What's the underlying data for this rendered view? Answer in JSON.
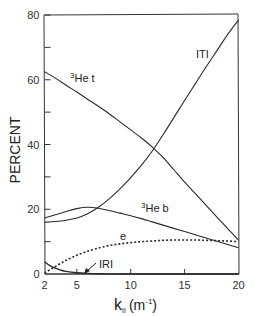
{
  "chart_data": {
    "type": "line",
    "title": "",
    "xlabel": "k_∥ (m⁻¹)",
    "xlabel_parts": {
      "main": "k",
      "sub": "II",
      "unit": "(m",
      "sup": "-1",
      "close": ")"
    },
    "ylabel": "PERCENT",
    "xlim": [
      2,
      20
    ],
    "ylim": [
      0,
      80
    ],
    "xticks": [
      2,
      5,
      10,
      15,
      20
    ],
    "yticks": [
      0,
      20,
      40,
      60,
      80
    ],
    "yticks_minor": [
      10,
      30,
      50,
      70
    ],
    "grid": false,
    "legend": "inline labels",
    "series": [
      {
        "name": "³He t",
        "label_sup": "3",
        "label_main": "He t",
        "style": "solid",
        "x": [
          2,
          3,
          4,
          5,
          6,
          7,
          8,
          9,
          10,
          11,
          12,
          13,
          14,
          15,
          16,
          17,
          18,
          19,
          20
        ],
        "y": [
          62.5,
          60.5,
          58.3,
          56.2,
          54.0,
          51.8,
          49.5,
          47.0,
          44.5,
          42.0,
          39.2,
          36.0,
          32.2,
          28.4,
          24.8,
          21.2,
          17.6,
          14.0,
          10.5
        ]
      },
      {
        "name": "ITI",
        "label_main": "ITI",
        "style": "solid",
        "x": [
          2,
          3,
          4,
          5,
          6,
          7,
          8,
          9,
          10,
          11,
          12,
          13,
          14,
          15,
          16,
          17,
          18,
          19,
          20
        ],
        "y": [
          16.0,
          16.2,
          16.6,
          17.3,
          18.6,
          20.6,
          23.2,
          26.3,
          29.8,
          33.6,
          38.0,
          43.0,
          48.3,
          53.6,
          58.8,
          64.0,
          69.0,
          74.0,
          78.5
        ]
      },
      {
        "name": "³He b",
        "label_sup": "3",
        "label_main": "He b",
        "style": "solid",
        "x": [
          2,
          3,
          4,
          5,
          6,
          7,
          8,
          9,
          10,
          11,
          12,
          13,
          14,
          15,
          16,
          17,
          18,
          19,
          20
        ],
        "y": [
          17.3,
          18.3,
          19.3,
          20.2,
          20.6,
          20.3,
          19.6,
          18.8,
          18.0,
          17.1,
          16.1,
          15.1,
          14.1,
          13.1,
          12.1,
          11.1,
          10.1,
          9.1,
          8.1
        ]
      },
      {
        "name": "e",
        "label_main": "e",
        "style": "dotted",
        "x": [
          2,
          3,
          4,
          5,
          6,
          7,
          8,
          9,
          10,
          11,
          12,
          13,
          14,
          15,
          16,
          17,
          18,
          19,
          20
        ],
        "y": [
          0.3,
          2.3,
          4.2,
          5.8,
          7.0,
          8.0,
          8.8,
          9.3,
          9.7,
          10.0,
          10.2,
          10.4,
          10.5,
          10.5,
          10.5,
          10.4,
          10.3,
          10.2,
          10.0
        ]
      },
      {
        "name": "IRI",
        "label_main": "IRI",
        "style": "solid",
        "x": [
          2,
          2.5,
          3,
          3.5,
          4,
          5,
          6,
          7,
          8,
          10,
          12,
          14,
          16,
          18,
          20
        ],
        "y": [
          3.8,
          2.6,
          1.8,
          1.2,
          0.8,
          0.4,
          0.2,
          0.1,
          0.05,
          0,
          0,
          0,
          0,
          0,
          0
        ]
      }
    ],
    "annotations": [
      {
        "text": "IRI",
        "arrow_to": {
          "x": 5,
          "y": 0.3
        },
        "position": {
          "x": 7.2,
          "y": 3.5
        }
      }
    ]
  },
  "colors": {
    "line": "#2a2a2a",
    "axis": "#333333",
    "background": "#ffffff"
  }
}
